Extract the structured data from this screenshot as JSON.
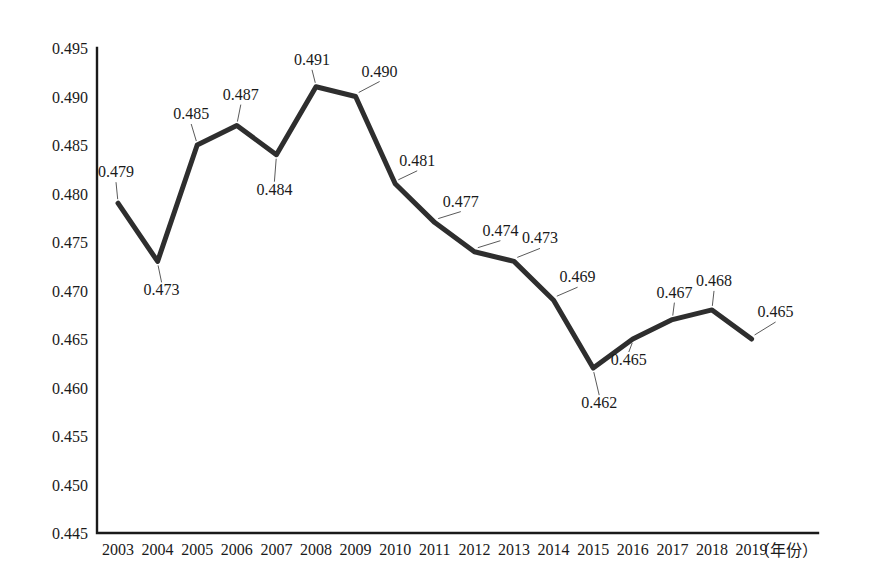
{
  "chart_data": {
    "type": "line",
    "title": "",
    "subtitle": "",
    "xlabel": "（年份）",
    "ylabel": "",
    "grid": false,
    "legend": "none",
    "categories": [
      "2003",
      "2004",
      "2005",
      "2006",
      "2007",
      "2008",
      "2009",
      "2010",
      "2011",
      "2012",
      "2013",
      "2014",
      "2015",
      "2016",
      "2017",
      "2018",
      "2019"
    ],
    "values": [
      0.479,
      0.473,
      0.485,
      0.487,
      0.484,
      0.491,
      0.49,
      0.481,
      0.477,
      0.474,
      0.473,
      0.469,
      0.462,
      0.465,
      0.467,
      0.468,
      0.465
    ],
    "point_labels": [
      "0.479",
      "0.473",
      "0.485",
      "0.487",
      "0.484",
      "0.491",
      "0.490",
      "0.481",
      "0.477",
      "0.474",
      "0.473",
      "0.469",
      "0.462",
      "0.465",
      "0.467",
      "0.468",
      "0.465"
    ],
    "ylim": [
      0.445,
      0.495
    ],
    "ytick_step": 0.005,
    "ytick_labels": [
      "0.495",
      "0.490",
      "0.485",
      "0.480",
      "0.475",
      "0.470",
      "0.465",
      "0.460",
      "0.455",
      "0.450",
      "0.445"
    ],
    "ytick_values": [
      0.495,
      0.49,
      0.485,
      0.48,
      0.475,
      0.47,
      0.465,
      0.46,
      0.455,
      0.45,
      0.445
    ],
    "series_color": "#2e2e2e",
    "axis_color": "#1a1a1a",
    "background_color": "#ffffff",
    "line_width": 5
  }
}
